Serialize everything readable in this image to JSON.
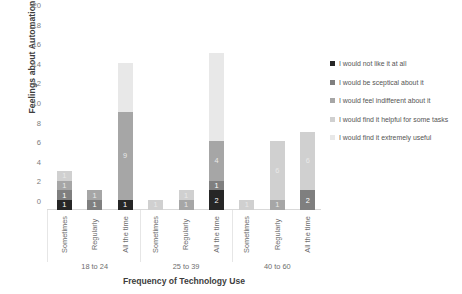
{
  "chart_data": {
    "type": "bar",
    "subtype": "stacked-bar",
    "title": "",
    "xlabel": "Frequency of Technology Use",
    "ylabel": "Feelings about Automation",
    "ylim": [
      0,
      20
    ],
    "yticks": [
      0,
      2,
      4,
      6,
      8,
      10,
      12,
      14,
      16,
      18,
      20
    ],
    "grid": false,
    "legend_position": "right",
    "groups": [
      "18 to 24",
      "25 to 39",
      "40 to 60"
    ],
    "categories": [
      "Sometimes",
      "Regularly",
      "All the time",
      "Sometimes",
      "Regularly",
      "All the time",
      "Sometimes",
      "Regularly",
      "All the time"
    ],
    "series": [
      {
        "name": "I would not like it at all",
        "color": "#262626",
        "values": [
          1,
          0,
          1,
          0,
          0,
          2,
          0,
          0,
          0
        ]
      },
      {
        "name": "I would be sceptical about it",
        "color": "#7f7f7f",
        "values": [
          1,
          1,
          0,
          0,
          0,
          1,
          0,
          0,
          2
        ]
      },
      {
        "name": "I would feel indifferent about it",
        "color": "#a6a6a6",
        "values": [
          1,
          1,
          9,
          0,
          1,
          4,
          0,
          1,
          0
        ]
      },
      {
        "name": "I would find it helpful for some tasks",
        "color": "#d0d0d0",
        "values": [
          1,
          0,
          0,
          1,
          1,
          0,
          1,
          6,
          6
        ]
      },
      {
        "name": "I would find it extremely useful",
        "color": "#e8e8e8",
        "values": [
          0,
          0,
          5,
          0,
          0,
          9,
          0,
          0,
          0
        ]
      }
    ],
    "totals": [
      4,
      2,
      15,
      1,
      2,
      16,
      1,
      7,
      8
    ]
  }
}
